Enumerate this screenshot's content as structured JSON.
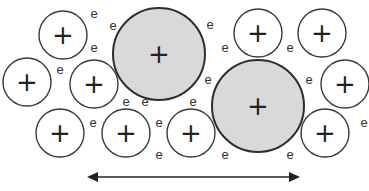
{
  "diagram": {
    "small_ions": [
      {
        "cx": 63,
        "cy": 35,
        "r": 24,
        "label": "+"
      },
      {
        "cx": 27,
        "cy": 82,
        "r": 24,
        "label": "+"
      },
      {
        "cx": 94,
        "cy": 84,
        "r": 24,
        "label": "+"
      },
      {
        "cx": 60,
        "cy": 133,
        "r": 24,
        "label": "+"
      },
      {
        "cx": 126,
        "cy": 133,
        "r": 24,
        "label": "+"
      },
      {
        "cx": 191,
        "cy": 133,
        "r": 24,
        "label": "+"
      },
      {
        "cx": 258,
        "cy": 33,
        "r": 24,
        "label": "+"
      },
      {
        "cx": 322,
        "cy": 33,
        "r": 24,
        "label": "+"
      },
      {
        "cx": 345,
        "cy": 84,
        "r": 24,
        "label": "+"
      },
      {
        "cx": 325,
        "cy": 133,
        "r": 24,
        "label": "+"
      }
    ],
    "large_ions": [
      {
        "cx": 159,
        "cy": 54,
        "r": 46,
        "label": "+",
        "fill": "#d9d9d9"
      },
      {
        "cx": 258,
        "cy": 106,
        "r": 46,
        "label": "+",
        "fill": "#d9d9d9"
      }
    ],
    "electrons": [
      {
        "x": 94,
        "y": 13,
        "label": "e"
      },
      {
        "x": 113,
        "y": 25,
        "label": "e"
      },
      {
        "x": 94,
        "y": 47,
        "label": "e"
      },
      {
        "x": 60,
        "y": 69,
        "label": "e"
      },
      {
        "x": 210,
        "y": 24,
        "label": "e"
      },
      {
        "x": 225,
        "y": 47,
        "label": "e"
      },
      {
        "x": 290,
        "y": 47,
        "label": "e"
      },
      {
        "x": 208,
        "y": 79,
        "label": "e"
      },
      {
        "x": 309,
        "y": 79,
        "label": "e"
      },
      {
        "x": 126,
        "y": 101,
        "label": "e"
      },
      {
        "x": 145,
        "y": 101,
        "label": "e"
      },
      {
        "x": 193,
        "y": 101,
        "label": "e"
      },
      {
        "x": 93,
        "y": 122,
        "label": "e"
      },
      {
        "x": 159,
        "y": 122,
        "label": "e"
      },
      {
        "x": 159,
        "y": 154,
        "label": "e"
      },
      {
        "x": 225,
        "y": 154,
        "label": "e"
      },
      {
        "x": 290,
        "y": 154,
        "label": "e"
      },
      {
        "x": 364,
        "y": 122,
        "label": "e"
      }
    ],
    "arrow": {
      "x1": 87,
      "x2": 300,
      "y": 177,
      "direction": "double"
    }
  }
}
